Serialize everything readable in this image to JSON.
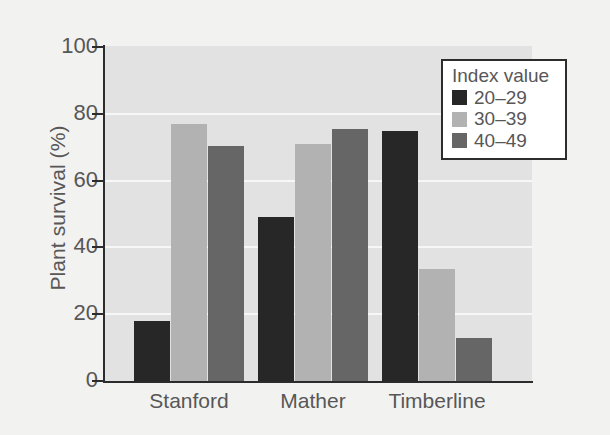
{
  "chart_data": {
    "type": "bar",
    "title": "",
    "xlabel": "",
    "ylabel": "Plant survival (%)",
    "ylim": [
      0,
      100
    ],
    "yticks": [
      0,
      20,
      40,
      60,
      80,
      100
    ],
    "ytick_labels": [
      "0",
      "20",
      "40",
      "60",
      "80",
      "100"
    ],
    "grid": true,
    "grid_axis": "y",
    "categories": [
      "Stanford",
      "Mather",
      "Timberline"
    ],
    "legend_title": "Index value",
    "legend_position": "upper right",
    "series": [
      {
        "name": "20-29",
        "label": "20–29",
        "color": "#272727",
        "values": [
          18,
          49,
          75
        ]
      },
      {
        "name": "30-39",
        "label": "30–39",
        "color": "#b2b2b2",
        "values": [
          77,
          71,
          33.5
        ]
      },
      {
        "name": "40-49",
        "label": "40–49",
        "color": "#666666",
        "values": [
          70.5,
          75.5,
          13
        ]
      }
    ],
    "colors": {
      "plot_background": "#e2e2e2",
      "figure_background": "#f2f2f0",
      "gridline": "#f7f7f7",
      "axis": "#2c2c2c",
      "text": "#575757"
    }
  }
}
